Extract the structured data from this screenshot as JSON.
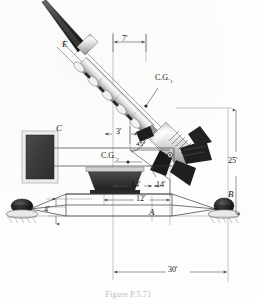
{
  "figure": {
    "caption": "Figure P.5.71",
    "type": "engineering-statics-diagram"
  },
  "points": {
    "E": "E",
    "C": "C",
    "D": "D",
    "A": "A",
    "B": "B",
    "cg1_prefix": "C.G.",
    "cg1_sub": "1",
    "cg2_prefix": "C.G.",
    "cg2_sub": "2"
  },
  "dimensions": {
    "rocket_tip_offset": "7'",
    "rail_offset": "3'",
    "launcher_left": "14'",
    "launcher_right": "14'",
    "frame_top": "12'",
    "frame_height": "4'",
    "tower_height": "25'",
    "span": "30'"
  },
  "angles": {
    "launch_elevation": "45"
  },
  "colors": {
    "line": "#3a3a3a",
    "dim_line": "#555555",
    "counterweight": "#3d3d3d",
    "support": "#2e2e2e",
    "rocket_body": "#dcdcdc",
    "rocket_nose": "#2b2b2b",
    "fin": "#1f1f1f"
  }
}
